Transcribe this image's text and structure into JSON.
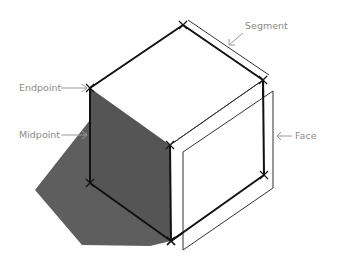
{
  "diagram": {
    "labels": {
      "endpoint": "Endpoint",
      "midpoint": "Midpoint",
      "segment": "Segment",
      "face": "Face"
    },
    "colors": {
      "edge": "#111111",
      "shade": "#5a5a5a",
      "annotation": "#8a8a8a",
      "background": "#ffffff"
    }
  }
}
